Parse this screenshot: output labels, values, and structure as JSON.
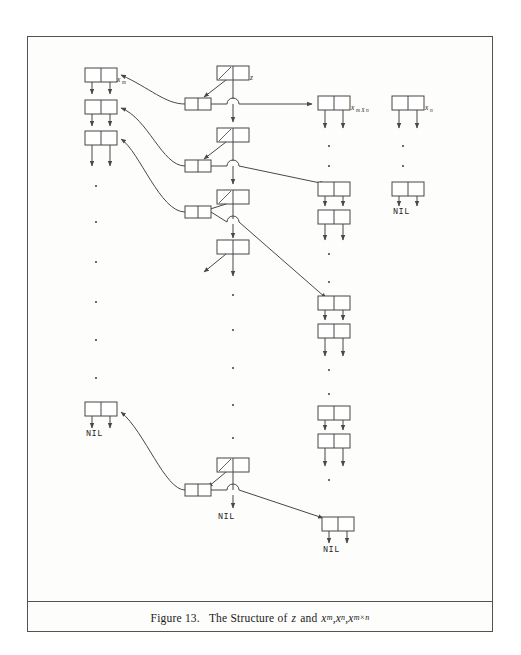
{
  "figure": {
    "caption_prefix": "Figure 13.",
    "caption_text": "The Structure of",
    "caption_vars": "z and",
    "caption_full": "Figure 13.   The Structure of z and xm, xn, xm×n",
    "frame_color": "#55524f",
    "ink_color": "#4a4744",
    "paper_color": "#fdfdfc"
  },
  "labels": {
    "z": "z",
    "x_m": "x",
    "x_m_sub": "m",
    "x_n": "x",
    "x_n_sub": "n",
    "x_mn": "x",
    "x_mn_sub": "m X n",
    "nil": "NIL"
  },
  "nil_markers": [
    {
      "id": "nil-right-mid",
      "text": "NIL"
    },
    {
      "id": "nil-left-bottom",
      "text": "NIL"
    },
    {
      "id": "nil-center-bottom",
      "text": "NIL"
    },
    {
      "id": "nil-right-bottom",
      "text": "NIL"
    }
  ],
  "structure": {
    "description": "cons-cell linked structure diagram",
    "left_column_nodes": 4,
    "center_column_nodes": 5,
    "right_column_groups": 4,
    "ellipsis_dot_columns": 3
  },
  "caption_parts": {
    "fig_no": "Figure 13.",
    "text": "The Structure of",
    "z": "z",
    "and": "and",
    "xm": "x",
    "xm_sub": "m",
    "comma1": ",",
    "xn": "x",
    "xn_sub": "n",
    "comma2": ",",
    "xmn": "x",
    "xmn_sub": "m×n"
  }
}
